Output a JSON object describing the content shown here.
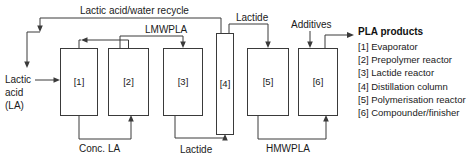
{
  "diagram": {
    "units": [
      {
        "tag": "[1]",
        "name": "Evaporator"
      },
      {
        "tag": "[2]",
        "name": "Prepolymer reactor"
      },
      {
        "tag": "[3]",
        "name": "Lactide reactor"
      },
      {
        "tag": "[4]",
        "name": "Distillation column"
      },
      {
        "tag": "[5]",
        "name": "Polymerisation reactor"
      },
      {
        "tag": "[6]",
        "name": "Compounder/finisher"
      }
    ],
    "streams": {
      "recycle": "Lactic acid/water recycle",
      "feed_line1": "Lactic",
      "feed_line2": "acid",
      "feed_line3": "(LA)",
      "conc_la": "Conc. LA",
      "lmwpla": "LMWPLA",
      "lactide_bottom": "Lactide",
      "lactide_top": "Lactide",
      "hmwpla": "HMWPLA",
      "additives": "Additives",
      "product": "PLA products"
    },
    "legend": {
      "heading": "PLA products",
      "items": [
        "[1] Evaporator",
        "[2] Prepolymer reactor",
        "[3] Lactide reactor",
        "[4] Distillation column",
        "[5] Polymerisation reactor",
        "[6] Compounder/finisher"
      ]
    },
    "colors": {
      "line": "#3a3a3a",
      "text": "#1a1a1a",
      "background": "#ffffff"
    }
  }
}
